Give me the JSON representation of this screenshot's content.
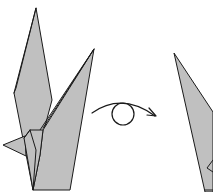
{
  "diagram": {
    "kind": "origami-step",
    "colors": {
      "paper": "#c0c0c0",
      "outline": "#1a1a1a",
      "background": "#ffffff"
    },
    "figures": [
      {
        "id": "crane-front",
        "description": "Folded model (crane base) with two raised points and a small side flap"
      },
      {
        "id": "turn-over-symbol",
        "description": "Curved arrow with circle: turn model over"
      },
      {
        "id": "crane-back",
        "description": "Result after turning over (partially visible)"
      }
    ],
    "symbol": {
      "name": "turn-over",
      "meaning": "Turn the model over"
    }
  }
}
